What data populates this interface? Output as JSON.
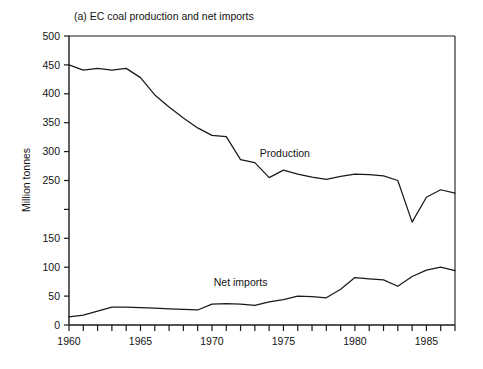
{
  "chart_data": {
    "type": "line",
    "title": "(a)  EC coal production and net imports",
    "xlabel": "",
    "ylabel": "Million tonnes",
    "xlim": [
      1960,
      1987
    ],
    "ylim": [
      0,
      500
    ],
    "grid": false,
    "legend_position": "inline-annotations",
    "x_ticks_every": 1,
    "x_tick_labels_every": 5,
    "y_tick_labels": [
      "0",
      "50",
      "100",
      "150",
      "",
      "250",
      "300",
      "350",
      "400",
      "450",
      "500"
    ],
    "y_tick_values": [
      0,
      50,
      100,
      150,
      200,
      250,
      300,
      350,
      400,
      450,
      500
    ],
    "x_tick_values": [
      1960,
      1961,
      1962,
      1963,
      1964,
      1965,
      1966,
      1967,
      1968,
      1969,
      1970,
      1971,
      1972,
      1973,
      1974,
      1975,
      1976,
      1977,
      1978,
      1979,
      1980,
      1981,
      1982,
      1983,
      1984,
      1985,
      1986,
      1987
    ],
    "x_tick_labels": [
      "1960",
      "",
      "",
      "",
      "",
      "1965",
      "",
      "",
      "",
      "",
      "1970",
      "",
      "",
      "",
      "",
      "1975",
      "",
      "",
      "",
      "",
      "1980",
      "",
      "",
      "",
      "",
      "1985",
      "",
      ""
    ],
    "x": [
      1960,
      1961,
      1962,
      1963,
      1964,
      1965,
      1966,
      1967,
      1968,
      1969,
      1970,
      1971,
      1972,
      1973,
      1974,
      1975,
      1976,
      1977,
      1978,
      1979,
      1980,
      1981,
      1982,
      1983,
      1984,
      1985,
      1986,
      1987
    ],
    "series": [
      {
        "name": "Production",
        "label": "Production",
        "color": "#1a1a1a",
        "label_x": 1975.1,
        "label_y": 291,
        "values": [
          450,
          441,
          444,
          441,
          444,
          428,
          398,
          377,
          358,
          341,
          328,
          326,
          286,
          281,
          255,
          268,
          261,
          256,
          252,
          257,
          261,
          260,
          258,
          250,
          178,
          221,
          234,
          228
        ]
      },
      {
        "name": "Net imports",
        "label": "Net imports",
        "color": "#1a1a1a",
        "label_x": 1972.0,
        "label_y": 68,
        "values": [
          14,
          17,
          24,
          31,
          31,
          30,
          29,
          28,
          27,
          26,
          36,
          37,
          36,
          34,
          40,
          44,
          50,
          49,
          47,
          62,
          82,
          80,
          78,
          67,
          84,
          95,
          100,
          94
        ]
      }
    ],
    "annotations": [
      {
        "text": "Production",
        "x": 1975.1,
        "y": 291
      },
      {
        "text": "Net imports",
        "x": 1972.0,
        "y": 68
      }
    ]
  },
  "figure": {
    "background_color": "#ffffff",
    "line_color": "#1a1a1a",
    "plot_left": 69,
    "plot_right": 455,
    "plot_top": 36,
    "plot_bottom": 325
  }
}
